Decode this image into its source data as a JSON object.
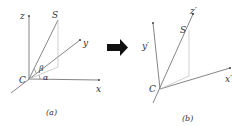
{
  "panel_a": {
    "caption": "(a)",
    "labels": {
      "z": "z",
      "S": "S",
      "y": "y",
      "C": "C",
      "beta": "β",
      "alpha": "α",
      "x": "x"
    }
  },
  "arrow": {
    "icon": "right-arrow-icon",
    "color": "#111111"
  },
  "panel_b": {
    "caption": "(b)",
    "labels": {
      "z_prime": "z′",
      "S": "S",
      "y_prime": "y′",
      "C": "C",
      "x_prime": "x′"
    }
  },
  "colors": {
    "axis": "#555555",
    "projection": "#bbbbbb",
    "text": "#333333"
  }
}
